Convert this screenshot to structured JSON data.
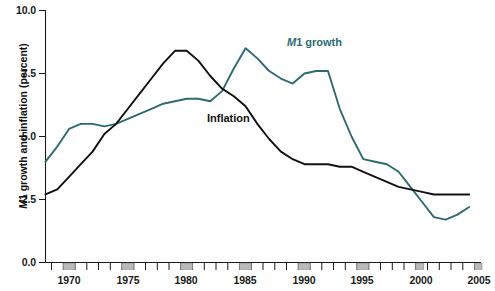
{
  "chart_data": {
    "type": "line",
    "title": "",
    "subtitle": "",
    "xlabel": "",
    "ylabel": "M1 growth and inflation (percent)",
    "ylabel_italic_prefix": "M",
    "ylabel_rest": "1 growth and inflation (percent)",
    "ylim": [
      0.0,
      10.0
    ],
    "xlim": [
      1969,
      2006
    ],
    "ytick_labels": [
      "0.0",
      "2.5",
      "5.0",
      "7.5",
      "10.0"
    ],
    "ytick_values": [
      0.0,
      2.5,
      5.0,
      7.5,
      10.0
    ],
    "xtick_labels": [
      "1970",
      "1975",
      "1980",
      "1985",
      "1990",
      "1995",
      "2000",
      "2005"
    ],
    "xtick_values": [
      1970,
      1975,
      1980,
      1985,
      1990,
      1995,
      2000,
      2005
    ],
    "xminor_step": 1,
    "grid": false,
    "legend_position": "inline-annotations",
    "shaded_bands_note": "gray recession markers on x-axis at labeled years",
    "shaded_band_years": [
      1970,
      1975,
      1980,
      1985,
      1990,
      1995,
      2000,
      2005
    ],
    "x": [
      1969,
      1970,
      1971,
      1972,
      1973,
      1974,
      1975,
      1976,
      1977,
      1978,
      1979,
      1980,
      1981,
      1982,
      1983,
      1984,
      1985,
      1986,
      1987,
      1988,
      1989,
      1990,
      1991,
      1992,
      1993,
      1994,
      1995,
      1996,
      1997,
      1998,
      1999,
      2000,
      2001,
      2002,
      2003,
      2004,
      2005
    ],
    "series": [
      {
        "name": "M1 growth",
        "color": "#2c6b73",
        "label": "M1 growth",
        "label_italic_prefix": "M",
        "label_rest": "1 growth",
        "values": [
          4.0,
          4.6,
          5.3,
          5.5,
          5.5,
          5.4,
          5.5,
          5.7,
          5.9,
          6.1,
          6.3,
          6.4,
          6.5,
          6.5,
          6.4,
          6.8,
          7.7,
          8.5,
          8.1,
          7.6,
          7.3,
          7.1,
          7.5,
          7.6,
          7.6,
          6.1,
          5.0,
          4.1,
          4.0,
          3.9,
          3.6,
          3.0,
          2.4,
          1.8,
          1.7,
          1.9,
          2.2
        ]
      },
      {
        "name": "Inflation",
        "color": "#111111",
        "label": "Inflation",
        "values": [
          2.7,
          2.9,
          3.4,
          3.9,
          4.4,
          5.1,
          5.5,
          6.1,
          6.7,
          7.3,
          7.9,
          8.4,
          8.4,
          8.0,
          7.4,
          6.9,
          6.6,
          6.2,
          5.5,
          4.9,
          4.4,
          4.1,
          3.9,
          3.9,
          3.9,
          3.8,
          3.8,
          3.6,
          3.4,
          3.2,
          3.0,
          2.9,
          2.8,
          2.7,
          2.7,
          2.7,
          2.7
        ]
      }
    ],
    "annotations": [
      {
        "name": "m1-growth-label",
        "text": "M1 growth",
        "x_px": 287,
        "y_px": 36,
        "color": "#2c6b73"
      },
      {
        "name": "inflation-label",
        "text": "Inflation",
        "x_px": 207,
        "y_px": 112,
        "color": "#111111"
      }
    ]
  }
}
